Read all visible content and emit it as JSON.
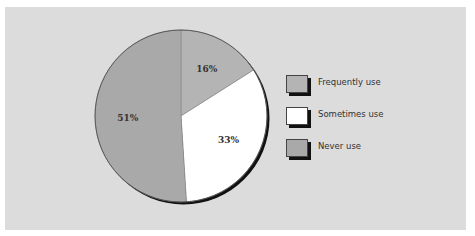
{
  "chart_data": {
    "type": "pie",
    "title": "",
    "slices": [
      {
        "label": "Frequently use",
        "value": 16,
        "display": "16%",
        "color": "#b4b4b4"
      },
      {
        "label": "Sometimes use",
        "value": 33,
        "display": "33%",
        "color": "#ffffff"
      },
      {
        "label": "Never use",
        "value": 51,
        "display": "51%",
        "color": "#a9a9a9"
      }
    ],
    "start_angle_deg": 0,
    "direction": "clockwise",
    "legend_position": "right",
    "legend": [
      "Frequently use",
      "Sometimes use",
      "Never use"
    ]
  },
  "colors": {
    "background": "#ffffff",
    "panel": "#dcdcdc",
    "outline": "#111111"
  }
}
